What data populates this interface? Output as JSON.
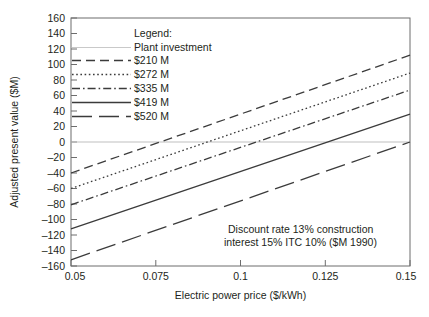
{
  "chart_data": {
    "type": "line",
    "title": "",
    "xlabel": "Electric power price ($/kWh)",
    "ylabel": "Adjusted present value ($M)",
    "xlim": [
      0.05,
      0.15
    ],
    "ylim": [
      -160,
      160
    ],
    "xticks": [
      "0.05",
      "0.075",
      "0.1",
      "0.125",
      "0.15"
    ],
    "xtick_values": [
      0.05,
      0.075,
      0.1,
      0.125,
      0.15
    ],
    "yticks": [
      "160",
      "140",
      "120",
      "100",
      "80",
      "60",
      "40",
      "20",
      "0",
      "–20",
      "–40",
      "–60",
      "–80",
      "–100",
      "–120",
      "–140",
      "–160"
    ],
    "ytick_values": [
      160,
      140,
      120,
      100,
      80,
      60,
      40,
      20,
      0,
      -20,
      -40,
      -60,
      -80,
      -100,
      -120,
      -140,
      -160
    ],
    "grid": false,
    "zero_reference_line": 0,
    "legend_position": "top-center",
    "x": [
      0.05,
      0.15
    ],
    "series": [
      {
        "name": "$210 M",
        "style": "dashed",
        "values": [
          -40,
          112
        ]
      },
      {
        "name": "$272 M",
        "style": "dotted",
        "values": [
          -60,
          89
        ]
      },
      {
        "name": "$335 M",
        "style": "dashdot",
        "values": [
          -81,
          67
        ]
      },
      {
        "name": "$419 M",
        "style": "solid",
        "values": [
          -112,
          36
        ]
      },
      {
        "name": "$520 M",
        "style": "longdash",
        "values": [
          -152,
          0
        ]
      }
    ],
    "annotations": [
      "Discount rate 13% construction",
      "interest 15% ITC 10% ($M 1990)"
    ]
  },
  "legend": {
    "title": "Legend:",
    "subtitle": "Plant investment",
    "entries": [
      {
        "label": "$210 M"
      },
      {
        "label": "$272 M"
      },
      {
        "label": "$335 M"
      },
      {
        "label": "$419 M"
      },
      {
        "label": "$520 M"
      }
    ]
  },
  "colors": {
    "line": "#3b3b3b",
    "axis": "#6d6d6d",
    "zero_line": "#bfbfbf",
    "text": "#231f20",
    "background": "#ffffff"
  }
}
